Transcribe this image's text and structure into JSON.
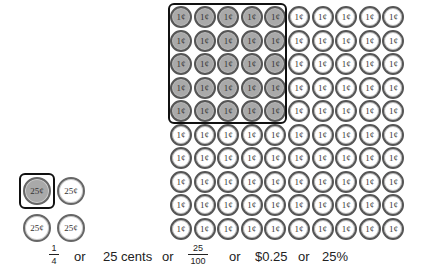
{
  "pennies": {
    "rows": 10,
    "cols": 10,
    "label": "1¢",
    "shaded_rows": 5,
    "shaded_cols": 5,
    "shaded_color": "#a9a9a9"
  },
  "quarters": {
    "count": 4,
    "label": "25¢",
    "shaded_count": 1
  },
  "equivalence": {
    "fraction1": {
      "numerator": "1",
      "denominator": "4"
    },
    "or1": "or",
    "cents": "25 cents",
    "or2": "or",
    "fraction2": {
      "numerator": "25",
      "denominator": "100"
    },
    "or3": "or",
    "dollars": "$0.25",
    "or4": "or",
    "percent": "25%"
  }
}
